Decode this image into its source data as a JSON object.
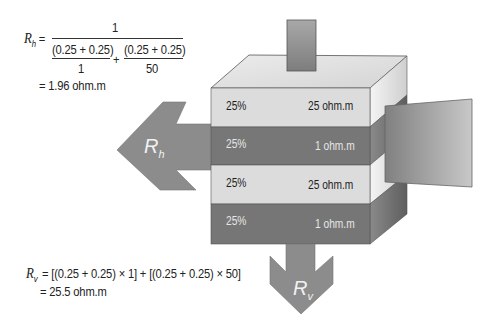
{
  "rh_equation": {
    "lhs": "R",
    "lhs_sub": "h",
    "equals": "=",
    "numerator": "1",
    "term1_num": "(0.25 + 0.25)",
    "term1_den": "1",
    "plus": "+",
    "term2_num": "(0.25 + 0.25)",
    "term2_den": "50",
    "result": "= 1.96 ohm.m"
  },
  "rv_equation": {
    "lhs": "R",
    "lhs_sub": "v",
    "expression": "= [(0.25 + 0.25) × 1] + [(0.25 + 0.25) × 50]",
    "result": "= 25.5 ohm.m"
  },
  "layers": [
    {
      "fraction": "25%",
      "resistivity": "25 ohm.m",
      "color": "#dcdcdc",
      "text": "dark"
    },
    {
      "fraction": "25%",
      "resistivity": "1 ohm.m",
      "color": "#7a7a7a",
      "text": "light"
    },
    {
      "fraction": "25%",
      "resistivity": "25 ohm.m",
      "color": "#dcdcdc",
      "text": "dark"
    },
    {
      "fraction": "25%",
      "resistivity": "1 ohm.m",
      "color": "#7a7a7a",
      "text": "light"
    }
  ],
  "arrows": {
    "horizontal": {
      "label": "R",
      "sub": "h"
    },
    "vertical": {
      "label": "R",
      "sub": "v"
    }
  },
  "colors": {
    "arrow": "#8a8a8a",
    "light_layer": "#dcdcdc",
    "dark_layer": "#767676",
    "top_face": "#e4e4e4",
    "edge": "#555555"
  }
}
